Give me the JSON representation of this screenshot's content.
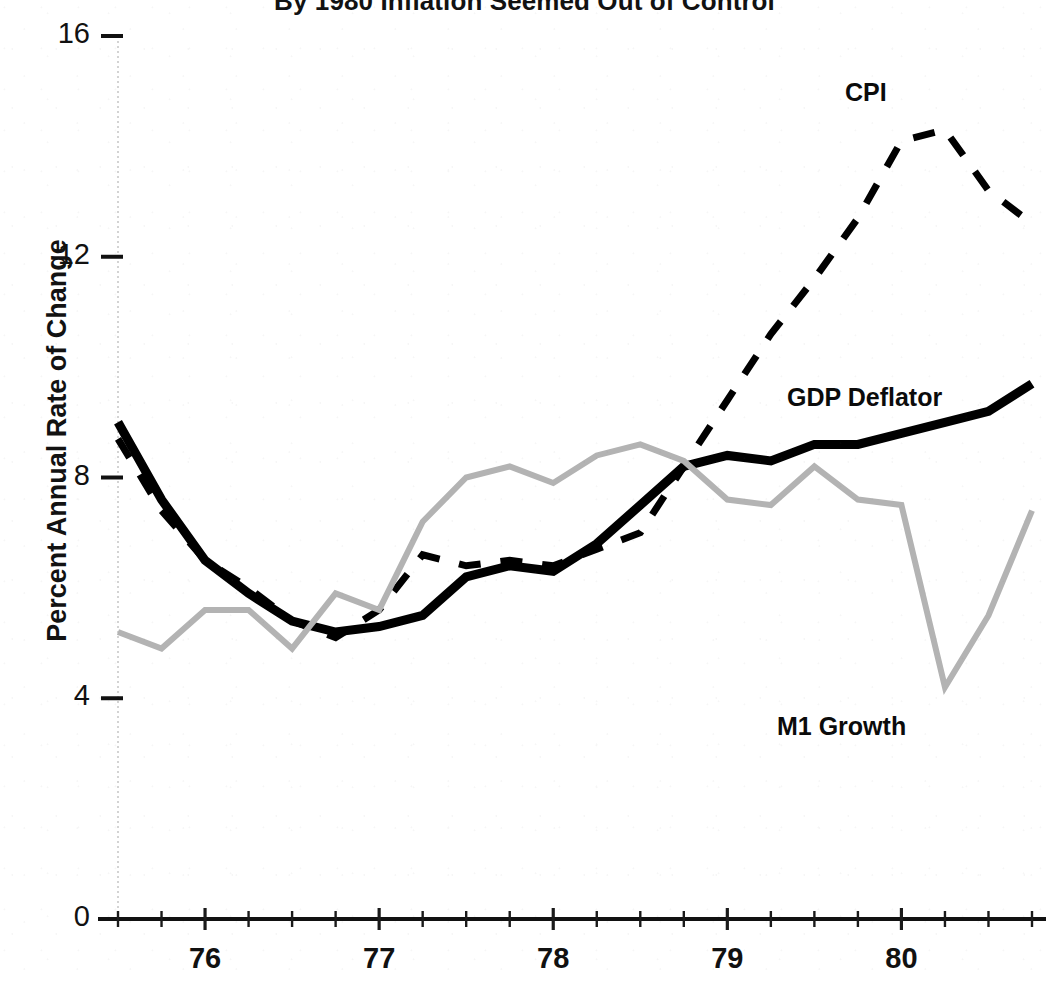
{
  "chart_data": {
    "type": "line",
    "title": "By 1980 Inflation Seemed Out of Control",
    "xlabel": "",
    "ylabel": "Percent Annual Rate of Change",
    "ylim": [
      0,
      16
    ],
    "yticks": [
      0,
      4,
      8,
      12,
      16
    ],
    "ytick_labels": [
      "0",
      "4",
      "8",
      "12",
      "16"
    ],
    "xlim": [
      1975.5,
      1980.75
    ],
    "xticks": [
      1976,
      1977,
      1978,
      1979,
      1980
    ],
    "xtick_labels": [
      "76",
      "77",
      "78",
      "79",
      "80"
    ],
    "minor_xticks_per_year": 4,
    "grid": false,
    "legend_position": "inline-annotations",
    "x": [
      1975.5,
      1975.75,
      1976.0,
      1976.25,
      1976.5,
      1976.75,
      1977.0,
      1977.25,
      1977.5,
      1977.75,
      1978.0,
      1978.25,
      1978.5,
      1978.75,
      1979.0,
      1979.25,
      1979.5,
      1979.75,
      1980.0,
      1980.25,
      1980.5,
      1980.75
    ],
    "series": [
      {
        "name": "CPI",
        "style": "dashed",
        "color": "#000000",
        "width": 7,
        "label_x": 1980.0,
        "label_y": 15.3,
        "values": [
          8.7,
          7.4,
          6.5,
          6.0,
          5.4,
          5.1,
          5.6,
          6.6,
          6.4,
          6.5,
          6.4,
          6.7,
          7.0,
          8.2,
          9.4,
          10.6,
          11.6,
          12.7,
          14.1,
          14.3,
          13.2,
          12.6
        ]
      },
      {
        "name": "GDP Deflator",
        "style": "solid",
        "color": "#000000",
        "width": 9,
        "label_x": 1979.5,
        "label_y": 9.5,
        "values": [
          9.0,
          7.6,
          6.5,
          5.9,
          5.4,
          5.2,
          5.3,
          5.5,
          6.2,
          6.4,
          6.3,
          6.8,
          7.5,
          8.2,
          8.4,
          8.3,
          8.6,
          8.6,
          8.8,
          9.0,
          9.2,
          9.7
        ]
      },
      {
        "name": "M1 Growth",
        "style": "solid",
        "color": "#b3b3b3",
        "width": 6,
        "label_x": 1979.5,
        "label_y": 4.6,
        "values": [
          5.2,
          4.9,
          5.6,
          5.6,
          4.9,
          5.9,
          5.6,
          7.2,
          8.0,
          8.2,
          7.9,
          8.4,
          8.6,
          8.3,
          7.6,
          7.5,
          8.2,
          7.6,
          7.5,
          4.2,
          5.5,
          7.4
        ]
      }
    ]
  },
  "axis": {
    "y_axis_label": "Percent Annual Rate of Change"
  }
}
